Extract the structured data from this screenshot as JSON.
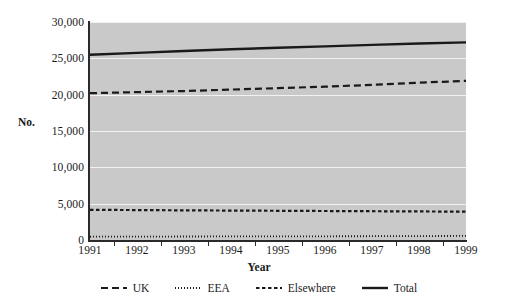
{
  "chart_data": {
    "type": "line",
    "title": "",
    "xlabel": "Year",
    "ylabel": "No.",
    "x": [
      1991,
      1992,
      1993,
      1994,
      1995,
      1996,
      1997,
      1998,
      1999
    ],
    "xtick_labels": [
      "1991",
      "1992",
      "1993",
      "1994",
      "1995",
      "1996",
      "1997",
      "1998",
      "1999"
    ],
    "ytick_labels": [
      "30,000",
      "25,000",
      "20,000",
      "15,000",
      "10,000",
      "5,000",
      "0"
    ],
    "ytick_values": [
      30000,
      25000,
      20000,
      15000,
      10000,
      5000,
      0
    ],
    "ylim": [
      0,
      30000
    ],
    "grid": true,
    "legend_position": "bottom",
    "plot_background": "#c9c9c9",
    "gridline_color": "#f2f2f2",
    "line_color": "#1a1a1a",
    "series": [
      {
        "name": "UK",
        "style": "long-dash",
        "dasharray": "7,4",
        "width": 2.2,
        "values": [
          20200,
          20350,
          20500,
          20700,
          20900,
          21100,
          21350,
          21650,
          21900
        ]
      },
      {
        "name": "EEA",
        "style": "dotted",
        "dasharray": "1,2",
        "width": 1.8,
        "values": [
          450,
          470,
          480,
          490,
          500,
          510,
          520,
          540,
          560
        ]
      },
      {
        "name": "Elsewhere",
        "style": "short-dash",
        "dasharray": "3.5,2.5",
        "width": 2.2,
        "values": [
          4150,
          4120,
          4080,
          4050,
          4020,
          3990,
          3960,
          3930,
          3900
        ]
      },
      {
        "name": "Total",
        "style": "solid",
        "dasharray": "0",
        "width": 2.4,
        "values": [
          25500,
          25750,
          26000,
          26250,
          26450,
          26650,
          26850,
          27050,
          27200
        ]
      }
    ]
  },
  "legend": {
    "items": [
      {
        "label": "UK"
      },
      {
        "label": "EEA"
      },
      {
        "label": "Elsewhere"
      },
      {
        "label": "Total"
      }
    ]
  }
}
